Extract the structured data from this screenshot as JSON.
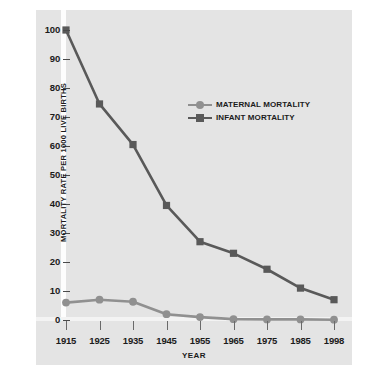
{
  "chart_data": {
    "type": "line",
    "title": "",
    "xlabel": "YEAR",
    "ylabel": "MORTALITY RATE PER 1000 LIVE BIRTHS",
    "categories": [
      "1915",
      "1925",
      "1935",
      "1945",
      "1955",
      "1965",
      "1975",
      "1985",
      "1998"
    ],
    "x": [
      1915,
      1925,
      1935,
      1945,
      1955,
      1965,
      1975,
      1985,
      1998
    ],
    "series": [
      {
        "name": "MATERNAL MORTALITY",
        "values": [
          6,
          7,
          6.3,
          2,
          1,
          0.3,
          0.2,
          0.2,
          0.1
        ],
        "color": "#909090",
        "marker": "circle"
      },
      {
        "name": "INFANT MORTALITY",
        "values": [
          100,
          74.5,
          60.5,
          39.5,
          27,
          23,
          17.5,
          11,
          7
        ],
        "color": "#595959",
        "marker": "square"
      }
    ],
    "ylim": [
      0,
      100
    ],
    "y_ticks": [
      "100",
      "90",
      "80",
      "70",
      "60",
      "50",
      "40",
      "30",
      "20",
      "10",
      "0"
    ],
    "y_tick_values": [
      100,
      90,
      80,
      70,
      60,
      50,
      40,
      30,
      20,
      10,
      0
    ],
    "grid": false,
    "legend_position": "upper-center",
    "plot_background": "#e4e4e4",
    "figure_background": "#ffffff",
    "axis_text_color": "#1b1b1b"
  }
}
